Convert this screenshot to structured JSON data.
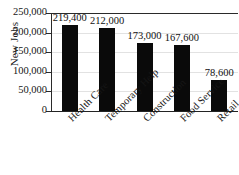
{
  "chart_data": {
    "type": "bar",
    "title": "",
    "subtitle": "",
    "xlabel": "",
    "ylabel": "New Jobs",
    "categories": [
      "Health Care",
      "Temporary Help",
      "Construction",
      "Food Service",
      "Retail"
    ],
    "values": [
      219400,
      212000,
      173000,
      167600,
      78600
    ],
    "value_labels": [
      "219,400",
      "212,000",
      "173,000",
      "167,600",
      "78,600"
    ],
    "ylim": [
      0,
      250000
    ],
    "ytick_values": [
      0,
      50000,
      100000,
      150000,
      200000,
      250000
    ],
    "ytick_labels": [
      "0",
      "50,000",
      "100,000",
      "150,000",
      "200,000",
      "250,000"
    ],
    "grid": true,
    "grid_axis": "y",
    "legend": false,
    "legend_position": "none",
    "bar_color": "#0a0a0a",
    "grid_color": "#e2e2e2",
    "axis_color": "#232323",
    "background_color": "#ffffff",
    "category_label_rotation": -45
  }
}
